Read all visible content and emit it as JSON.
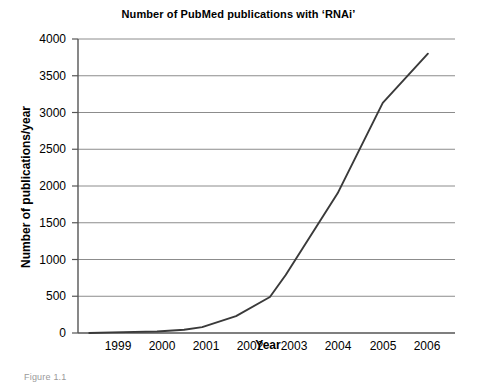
{
  "figure": {
    "caption": "Figure 1.1"
  },
  "chart_data": {
    "type": "line",
    "title": "Number of PubMed publications with ‘RNAi’",
    "xlabel": "Year",
    "ylabel": "Number of publications/year",
    "x": [
      1998.5,
      1999,
      2000,
      2001,
      2002,
      2003,
      2004,
      2005,
      2006
    ],
    "categories": [
      "1999",
      "2000",
      "2001",
      "2002",
      "2003",
      "2004",
      "2005",
      "2006"
    ],
    "xtick_labels": [
      "1999",
      "2000",
      "2001",
      "2002",
      "2003",
      "2004",
      "2005",
      "2006"
    ],
    "ytick_labels": [
      "0",
      "500",
      "1000",
      "1500",
      "2000",
      "2500",
      "3000",
      "3500",
      "4000"
    ],
    "ytick_values": [
      0,
      500,
      1000,
      1500,
      2000,
      2500,
      3000,
      3500,
      4000
    ],
    "xlim": [
      1998.25,
      2006.6
    ],
    "ylim": [
      0,
      4000
    ],
    "grid": "horizontal",
    "legend": "none",
    "series": [
      {
        "name": "Publications per year",
        "color": "#3a3a3a",
        "points": [
          {
            "x": 1998.5,
            "y": 0
          },
          {
            "x": 1999.0,
            "y": 8
          },
          {
            "x": 2000.0,
            "y": 20
          },
          {
            "x": 2000.6,
            "y": 45
          },
          {
            "x": 2001.0,
            "y": 80
          },
          {
            "x": 2001.75,
            "y": 230
          },
          {
            "x": 2002.5,
            "y": 490
          },
          {
            "x": 2002.85,
            "y": 790
          },
          {
            "x": 2004.0,
            "y": 1900
          },
          {
            "x": 2005.0,
            "y": 3130
          },
          {
            "x": 2006.0,
            "y": 3800
          }
        ]
      }
    ]
  },
  "axes": {
    "line_color": "#555555",
    "grid_color": "#8c8c8c",
    "data_color": "#3a3a3a"
  }
}
